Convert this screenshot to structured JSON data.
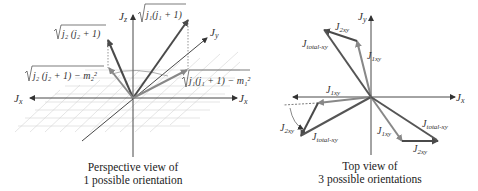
{
  "left_panel": {
    "caption_line1": "Perspective view of",
    "caption_line2": "1 possible orientation",
    "axes": {
      "z": "J",
      "z_sub": "z",
      "y": "J",
      "y_sub": "y",
      "x_left": "J",
      "x_left_sub": "x",
      "x_right": "J",
      "x_right_sub": "x"
    },
    "labels": {
      "j1_magnitude": "j₁(j₁ + 1)",
      "j2_magnitude": "j₂ (j₂ + 1)",
      "j2_projection": "j₂ (j₂ + 1) − m₂²",
      "j1_projection": "j₁(j₁ + 1) − m₁²"
    }
  },
  "right_panel": {
    "caption_line1": "Top view of",
    "caption_line2": "3 possible orientations",
    "axes": {
      "y": "J",
      "y_sub": "y",
      "x": "J",
      "x_sub": "x"
    },
    "orientations": [
      {
        "j1": "J",
        "j1_sub": "1xy",
        "j2": "J",
        "j2_sub": "2xy",
        "total": "J",
        "total_sub": "total-xy"
      },
      {
        "j1": "J",
        "j1_sub": "1xy",
        "j2": "J",
        "j2_sub": "2xy",
        "total": "J",
        "total_sub": "total-xy"
      },
      {
        "j1": "J",
        "j1_sub": "1xy",
        "j2": "J",
        "j2_sub": "2xy",
        "total": "J",
        "total_sub": "total-xy"
      }
    ]
  },
  "colors": {
    "axis": "#333333",
    "vector_dark": "#4a4a4a",
    "vector_light": "#888888",
    "grid": "#cccccc"
  }
}
